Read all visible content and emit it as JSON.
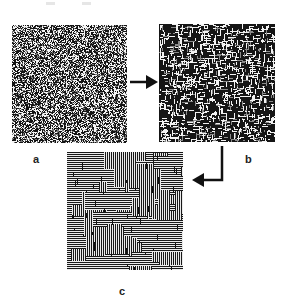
{
  "figure": {
    "panels": [
      {
        "id": "a",
        "label": "a",
        "pattern": "random-noise",
        "x": 12,
        "y": 25,
        "w": 115,
        "h": 118
      },
      {
        "id": "b",
        "label": "b",
        "pattern": "short-segments-noise",
        "x": 159,
        "y": 24,
        "w": 116,
        "h": 118
      },
      {
        "id": "c",
        "label": "c",
        "pattern": "striped-domains",
        "x": 67,
        "y": 152,
        "w": 116,
        "h": 118
      }
    ],
    "arrows": [
      {
        "name": "arrow-a-to-b",
        "direction": "right"
      },
      {
        "name": "arrow-b-to-c",
        "direction": "down-left"
      }
    ],
    "colors": {
      "ink": "#111111",
      "paper": "#ffffff",
      "label": "#222222"
    }
  }
}
